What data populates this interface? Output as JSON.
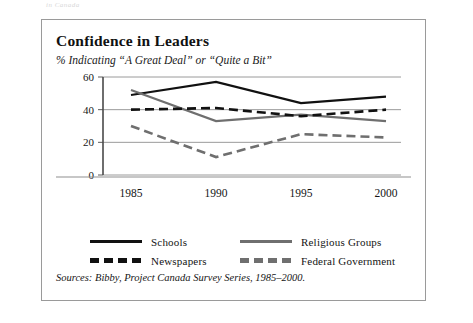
{
  "running_head": "in Canada",
  "figure": {
    "title": "Confidence in Leaders",
    "subtitle": "% Indicating “A Great Deal” or “Quite a Bit”",
    "source": "Sources: Bibby, Project Canada Survey Series, 1985–2000."
  },
  "colors": {
    "black": "#111111",
    "gray": "#6f6f6f",
    "grid": "#8f8f8f",
    "axis": "#4a4a4a",
    "border": "#9a9a9a",
    "background": "#ffffff"
  },
  "legend": {
    "position": "below-plot",
    "entries": [
      {
        "label": "Schools",
        "color": "#111111",
        "style": "solid"
      },
      {
        "label": "Religious Groups",
        "color": "#6f6f6f",
        "style": "solid"
      },
      {
        "label": "Newspapers",
        "color": "#111111",
        "style": "dashed"
      },
      {
        "label": "Federal Government",
        "color": "#6f6f6f",
        "style": "dashed"
      }
    ]
  },
  "chart_data": {
    "type": "line",
    "title": "Confidence in Leaders",
    "subtitle": "% Indicating “A Great Deal” or “Quite a Bit”",
    "xlabel": "",
    "ylabel": "",
    "x": [
      1985,
      1990,
      1995,
      2000
    ],
    "xtick_labels": [
      "1985",
      "1990",
      "1995",
      "2000"
    ],
    "ytick_labels": [
      "0",
      "20",
      "40",
      "60"
    ],
    "yticks": [
      0,
      20,
      40,
      60
    ],
    "ylim": [
      0,
      60
    ],
    "grid": "horizontal",
    "series": [
      {
        "name": "Schools",
        "color": "#111111",
        "style": "solid",
        "values": [
          49,
          57,
          44,
          48
        ]
      },
      {
        "name": "Religious Groups",
        "color": "#6f6f6f",
        "style": "solid",
        "values": [
          52,
          33,
          37,
          33
        ]
      },
      {
        "name": "Newspapers",
        "color": "#111111",
        "style": "dashed",
        "values": [
          40,
          41,
          36,
          40
        ]
      },
      {
        "name": "Federal Government",
        "color": "#6f6f6f",
        "style": "dashed",
        "values": [
          30,
          11,
          25,
          23
        ]
      }
    ]
  }
}
